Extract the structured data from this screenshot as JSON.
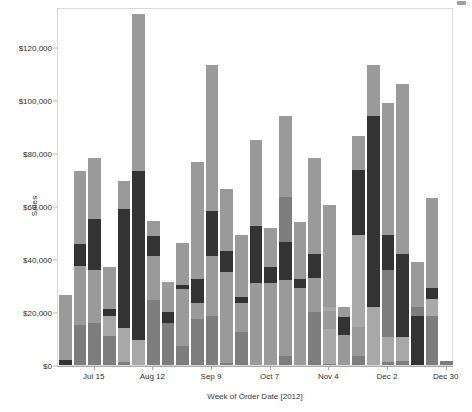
{
  "chart_data": {
    "type": "bar",
    "subtype": "stacked-bar",
    "title": "",
    "xlabel": "Week of Order Date [2012]",
    "ylabel": "Sales",
    "ylim": [
      0,
      135000
    ],
    "ytick_values": [
      0,
      20000,
      40000,
      60000,
      80000,
      100000,
      120000
    ],
    "ytick_labels": [
      "$0",
      "$20,000",
      "$40,000",
      "$60,000",
      "$80,000",
      "$100,000",
      "$120,000"
    ],
    "grid": false,
    "legend": "none",
    "x_axis_tick_labels": [
      "Jul 15",
      "Aug 12",
      "Sep 9",
      "Oct 7",
      "Nov 4",
      "Dec 2",
      "Dec 30"
    ],
    "x_axis_tick_indices": [
      2,
      6,
      10,
      14,
      18,
      22,
      26
    ],
    "categories": [
      "Jul 1",
      "Jul 8",
      "Jul 15",
      "Jul 22",
      "Jul 29",
      "Aug 5",
      "Aug 12",
      "Aug 19",
      "Aug 26",
      "Sep 2",
      "Sep 9",
      "Sep 16",
      "Sep 23",
      "Sep 30",
      "Oct 7",
      "Oct 14",
      "Oct 21",
      "Oct 28",
      "Nov 4",
      "Nov 11",
      "Nov 18",
      "Nov 25",
      "Dec 2",
      "Dec 9",
      "Dec 16",
      "Dec 23",
      "Dec 30"
    ],
    "series": [
      {
        "name": "Segment A",
        "color": "#7d7d7d",
        "values": [
          2500,
          15000,
          16000,
          11000,
          14000,
          9500,
          24500,
          16000,
          7000,
          17500,
          18500,
          0,
          12500,
          0,
          0,
          3500,
          0,
          20000,
          12000,
          3500,
          14500,
          0,
          0,
          10500,
          0,
          18500,
          0
        ]
      },
      {
        "name": "Segment B",
        "color": "#a8a8a8",
        "values": [
          0,
          0,
          0,
          0,
          0,
          0,
          0,
          0,
          0,
          0,
          0,
          0,
          0,
          0,
          0,
          0,
          0,
          1500,
          0,
          0,
          0,
          0,
          1500,
          0,
          1500,
          0,
          0
        ]
      },
      {
        "name": "Segment C dark",
        "color": "#333333",
        "values": [
          2000,
          0,
          0,
          2500,
          0,
          0,
          0,
          0,
          0,
          0,
          0,
          0,
          0,
          0,
          0,
          0,
          0,
          0,
          0,
          0,
          0,
          0,
          0,
          0,
          0,
          0,
          0
        ]
      }
    ],
    "bar_segments": [
      {
        "category": "Jul 1",
        "total": 26500,
        "stack": [
          {
            "color": "#333333",
            "from": 0,
            "to": 2000
          },
          {
            "color": "#9a9a9a",
            "from": 2000,
            "to": 26500
          }
        ]
      },
      {
        "category": "Jul 8",
        "total": 73000,
        "stack": [
          {
            "color": "#7d7d7d",
            "from": 0,
            "to": 15000
          },
          {
            "color": "#9a9a9a",
            "from": 15000,
            "to": 37500
          },
          {
            "color": "#333333",
            "from": 37500,
            "to": 45500
          },
          {
            "color": "#9a9a9a",
            "from": 45500,
            "to": 73000
          }
        ]
      },
      {
        "category": "Jul 15",
        "total": 78000,
        "stack": [
          {
            "color": "#7d7d7d",
            "from": 0,
            "to": 16000
          },
          {
            "color": "#9a9a9a",
            "from": 16000,
            "to": 36000
          },
          {
            "color": "#333333",
            "from": 36000,
            "to": 55000
          },
          {
            "color": "#9a9a9a",
            "from": 55000,
            "to": 78000
          }
        ]
      },
      {
        "category": "Jul 22",
        "total": 37000,
        "stack": [
          {
            "color": "#7d7d7d",
            "from": 0,
            "to": 11000
          },
          {
            "color": "#a8a8a8",
            "from": 11000,
            "to": 18500
          },
          {
            "color": "#333333",
            "from": 18500,
            "to": 21000
          },
          {
            "color": "#9a9a9a",
            "from": 21000,
            "to": 37000
          }
        ]
      },
      {
        "category": "Jul 29",
        "total": 69500,
        "stack": [
          {
            "color": "#7d7d7d",
            "from": 0,
            "to": 1000
          },
          {
            "color": "#a8a8a8",
            "from": 1000,
            "to": 14000
          },
          {
            "color": "#333333",
            "from": 14000,
            "to": 59000
          },
          {
            "color": "#9a9a9a",
            "from": 59000,
            "to": 69500
          }
        ]
      },
      {
        "category": "Aug 5",
        "total": 132500,
        "stack": [
          {
            "color": "#a8a8a8",
            "from": 0,
            "to": 9500
          },
          {
            "color": "#333333",
            "from": 9500,
            "to": 73000
          },
          {
            "color": "#9a9a9a",
            "from": 73000,
            "to": 132500
          }
        ]
      },
      {
        "category": "Aug 12",
        "total": 54500,
        "stack": [
          {
            "color": "#7d7d7d",
            "from": 0,
            "to": 24500
          },
          {
            "color": "#9a9a9a",
            "from": 24500,
            "to": 41000
          },
          {
            "color": "#333333",
            "from": 41000,
            "to": 48500
          },
          {
            "color": "#9a9a9a",
            "from": 48500,
            "to": 54500
          }
        ]
      },
      {
        "category": "Aug 19",
        "total": 31500,
        "stack": [
          {
            "color": "#7d7d7d",
            "from": 0,
            "to": 16000
          },
          {
            "color": "#333333",
            "from": 16000,
            "to": 20000
          },
          {
            "color": "#9a9a9a",
            "from": 20000,
            "to": 31500
          }
        ]
      },
      {
        "category": "Aug 26",
        "total": 46000,
        "stack": [
          {
            "color": "#7d7d7d",
            "from": 0,
            "to": 7000
          },
          {
            "color": "#9a9a9a",
            "from": 7000,
            "to": 28500
          },
          {
            "color": "#333333",
            "from": 28500,
            "to": 30000
          },
          {
            "color": "#9a9a9a",
            "from": 30000,
            "to": 46000
          }
        ]
      },
      {
        "category": "Sep 2",
        "total": 76500,
        "stack": [
          {
            "color": "#7d7d7d",
            "from": 0,
            "to": 17500
          },
          {
            "color": "#9a9a9a",
            "from": 17500,
            "to": 23500
          },
          {
            "color": "#333333",
            "from": 23500,
            "to": 32500
          },
          {
            "color": "#9a9a9a",
            "from": 32500,
            "to": 76500
          }
        ]
      },
      {
        "category": "Sep 9",
        "total": 113000,
        "stack": [
          {
            "color": "#7d7d7d",
            "from": 0,
            "to": 18500
          },
          {
            "color": "#9a9a9a",
            "from": 18500,
            "to": 41000
          },
          {
            "color": "#333333",
            "from": 41000,
            "to": 58000
          },
          {
            "color": "#9a9a9a",
            "from": 58000,
            "to": 113000
          }
        ]
      },
      {
        "category": "Sep 16",
        "total": 66500,
        "stack": [
          {
            "color": "#7d7d7d",
            "from": 0,
            "to": 800
          },
          {
            "color": "#9a9a9a",
            "from": 800,
            "to": 35000
          },
          {
            "color": "#333333",
            "from": 35000,
            "to": 43000
          },
          {
            "color": "#9a9a9a",
            "from": 43000,
            "to": 66500
          }
        ]
      },
      {
        "category": "Sep 23",
        "total": 49000,
        "stack": [
          {
            "color": "#7d7d7d",
            "from": 0,
            "to": 12500
          },
          {
            "color": "#9a9a9a",
            "from": 12500,
            "to": 23500
          },
          {
            "color": "#333333",
            "from": 23500,
            "to": 25500
          },
          {
            "color": "#9a9a9a",
            "from": 25500,
            "to": 49000
          }
        ]
      },
      {
        "category": "Sep 30",
        "total": 85000,
        "stack": [
          {
            "color": "#9a9a9a",
            "from": 0,
            "to": 31000
          },
          {
            "color": "#333333",
            "from": 31000,
            "to": 52500
          },
          {
            "color": "#9a9a9a",
            "from": 52500,
            "to": 85000
          }
        ]
      },
      {
        "category": "Oct 7",
        "total": 51500,
        "stack": [
          {
            "color": "#9a9a9a",
            "from": 0,
            "to": 31000
          },
          {
            "color": "#333333",
            "from": 31000,
            "to": 37000
          },
          {
            "color": "#9a9a9a",
            "from": 37000,
            "to": 51500
          }
        ]
      },
      {
        "category": "Oct 14",
        "total": 94000,
        "stack": [
          {
            "color": "#7d7d7d",
            "from": 0,
            "to": 3500
          },
          {
            "color": "#9a9a9a",
            "from": 3500,
            "to": 32000
          },
          {
            "color": "#333333",
            "from": 32000,
            "to": 46500
          },
          {
            "color": "#7d7d7d",
            "from": 46500,
            "to": 63500
          },
          {
            "color": "#9a9a9a",
            "from": 63500,
            "to": 94000
          }
        ]
      },
      {
        "category": "Oct 21",
        "total": 54000,
        "stack": [
          {
            "color": "#9a9a9a",
            "from": 0,
            "to": 29000
          },
          {
            "color": "#333333",
            "from": 29000,
            "to": 32500
          },
          {
            "color": "#9a9a9a",
            "from": 32500,
            "to": 54000
          }
        ]
      },
      {
        "category": "Oct 28",
        "total": 78000,
        "stack": [
          {
            "color": "#7d7d7d",
            "from": 0,
            "to": 20000
          },
          {
            "color": "#9a9a9a",
            "from": 20000,
            "to": 33000
          },
          {
            "color": "#333333",
            "from": 33000,
            "to": 42000
          },
          {
            "color": "#9a9a9a",
            "from": 42000,
            "to": 78000
          }
        ]
      },
      {
        "category": "Nov 4",
        "total": 60500,
        "stack": [
          {
            "color": "#7d7d7d",
            "from": 0,
            "to": 500
          },
          {
            "color": "#a8a8a8",
            "from": 500,
            "to": 13500
          },
          {
            "color": "#9a9a9a",
            "from": 13500,
            "to": 20500
          },
          {
            "color": "#a8a8a8",
            "from": 20500,
            "to": 22000
          },
          {
            "color": "#9a9a9a",
            "from": 22000,
            "to": 60500
          }
        ]
      },
      {
        "category": "Nov 11",
        "total": 22000,
        "stack": [
          {
            "color": "#9a9a9a",
            "from": 0,
            "to": 11500
          },
          {
            "color": "#333333",
            "from": 11500,
            "to": 18000
          },
          {
            "color": "#9a9a9a",
            "from": 18000,
            "to": 22000
          }
        ]
      },
      {
        "category": "Nov 18",
        "total": 86500,
        "stack": [
          {
            "color": "#7d7d7d",
            "from": 0,
            "to": 3500
          },
          {
            "color": "#9a9a9a",
            "from": 3500,
            "to": 14500
          },
          {
            "color": "#a8a8a8",
            "from": 14500,
            "to": 49000
          },
          {
            "color": "#333333",
            "from": 49000,
            "to": 73500
          },
          {
            "color": "#9a9a9a",
            "from": 73500,
            "to": 86500
          }
        ]
      },
      {
        "category": "Nov 25",
        "total": 113000,
        "stack": [
          {
            "color": "#a8a8a8",
            "from": 0,
            "to": 22000
          },
          {
            "color": "#333333",
            "from": 22000,
            "to": 94000
          },
          {
            "color": "#9a9a9a",
            "from": 94000,
            "to": 113000
          }
        ]
      },
      {
        "category": "Dec 2",
        "total": 99000,
        "stack": [
          {
            "color": "#7d7d7d",
            "from": 0,
            "to": 1200
          },
          {
            "color": "#a8a8a8",
            "from": 1200,
            "to": 10500
          },
          {
            "color": "#7d7d7d",
            "from": 10500,
            "to": 36000
          },
          {
            "color": "#333333",
            "from": 36000,
            "to": 49000
          },
          {
            "color": "#9a9a9a",
            "from": 49000,
            "to": 99000
          }
        ]
      },
      {
        "category": "Dec 9",
        "total": 106000,
        "stack": [
          {
            "color": "#7d7d7d",
            "from": 0,
            "to": 1500
          },
          {
            "color": "#a8a8a8",
            "from": 1500,
            "to": 10500
          },
          {
            "color": "#333333",
            "from": 10500,
            "to": 42000
          },
          {
            "color": "#9a9a9a",
            "from": 42000,
            "to": 106000
          }
        ]
      },
      {
        "category": "Dec 16",
        "total": 39000,
        "stack": [
          {
            "color": "#333333",
            "from": 0,
            "to": 18500
          },
          {
            "color": "#7d7d7d",
            "from": 18500,
            "to": 22000
          },
          {
            "color": "#9a9a9a",
            "from": 22000,
            "to": 39000
          }
        ]
      },
      {
        "category": "Dec 23",
        "total": 63000,
        "stack": [
          {
            "color": "#7d7d7d",
            "from": 0,
            "to": 18500
          },
          {
            "color": "#a8a8a8",
            "from": 18500,
            "to": 25000
          },
          {
            "color": "#333333",
            "from": 25000,
            "to": 29000
          },
          {
            "color": "#9a9a9a",
            "from": 29000,
            "to": 63000
          }
        ]
      },
      {
        "category": "Dec 30",
        "total": 1500,
        "stack": [
          {
            "color": "#7d7d7d",
            "from": 0,
            "to": 1500
          }
        ]
      }
    ]
  },
  "axes": {
    "y_title": "Sales",
    "x_title": "Week of Order Date [2012]"
  },
  "artifact": {
    "corner_mark": "stray-mark"
  }
}
